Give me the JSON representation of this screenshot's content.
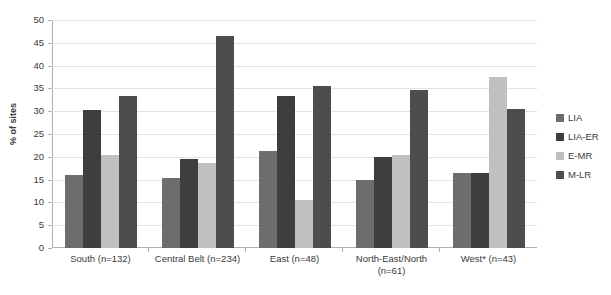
{
  "chart_data": {
    "type": "bar",
    "title": "",
    "xlabel": "",
    "ylabel": "% of sites",
    "ylim": [
      0,
      50
    ],
    "yticks": [
      0,
      5,
      10,
      15,
      20,
      25,
      30,
      35,
      40,
      45,
      50
    ],
    "grid": true,
    "legend_position": "right",
    "categories": [
      "South (n=132)",
      "Central Belt (n=234)",
      "East (n=48)",
      "North-East/North (n=61)",
      "West* (n=43)"
    ],
    "category_lines": [
      [
        "South (n=132)"
      ],
      [
        "Central Belt (n=234)"
      ],
      [
        "East (n=48)"
      ],
      [
        "North-East/North",
        "(n=61)"
      ],
      [
        "West* (n=43)"
      ]
    ],
    "series": [
      {
        "name": "LIA",
        "color": "#6d6d6d",
        "values": [
          16.0,
          15.3,
          21.3,
          15.0,
          16.5
        ]
      },
      {
        "name": "LIA-ER",
        "color": "#3e3e3e",
        "values": [
          30.3,
          19.5,
          33.3,
          20.0,
          16.5
        ]
      },
      {
        "name": "E-MR",
        "color": "#c0c0c0",
        "values": [
          20.5,
          18.7,
          10.5,
          20.3,
          37.5
        ]
      },
      {
        "name": "M-LR",
        "color": "#4d4d4d",
        "values": [
          33.3,
          46.5,
          35.5,
          34.7,
          30.5
        ]
      }
    ]
  },
  "axis": {
    "y_title": "% of sites"
  }
}
